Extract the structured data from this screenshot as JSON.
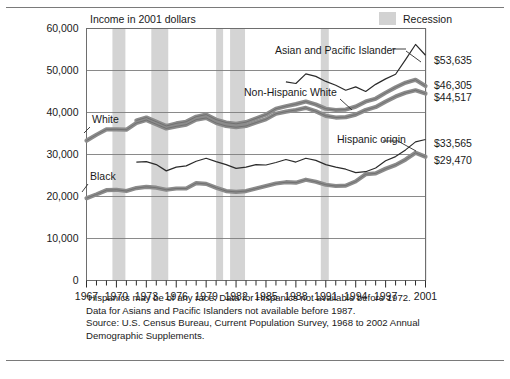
{
  "chart_data": {
    "type": "line",
    "title": "",
    "ylabel": "Income in 2001 dollars",
    "xlabel": "",
    "ylim": [
      0,
      60000
    ],
    "xlim": [
      1967,
      2001
    ],
    "grid": true,
    "ytick_labels": [
      "60,000",
      "50,000",
      "40,000",
      "30,000",
      "20,000",
      "10,000",
      "0"
    ],
    "ytick_values": [
      60000,
      50000,
      40000,
      30000,
      20000,
      10000,
      0
    ],
    "xtick_labels": [
      "1967",
      "1970",
      "1973",
      "1976",
      "1979",
      "1982",
      "1985",
      "1988",
      "1991",
      "1994",
      "1997",
      "2001"
    ],
    "xtick_values": [
      1967,
      1970,
      1973,
      1976,
      1979,
      1982,
      1985,
      1988,
      1991,
      1994,
      1997,
      2001
    ],
    "legend": [
      {
        "name": "Recession",
        "swatch": "#d2d2d2",
        "position": "top-right"
      }
    ],
    "recessions": [
      {
        "start": 1969.6,
        "end": 1970.9
      },
      {
        "start": 1973.5,
        "end": 1975.2
      },
      {
        "start": 1980.0,
        "end": 1980.7
      },
      {
        "start": 1981.4,
        "end": 1982.9
      },
      {
        "start": 1990.5,
        "end": 1991.3
      },
      {
        "start": 2001.0,
        "end": 2001.9
      }
    ],
    "series": [
      {
        "name": "White",
        "label": "White",
        "style": "thick",
        "color": "#8c8c8c",
        "end_value_label": "",
        "x": [
          1967,
          1968,
          1969,
          1970,
          1971,
          1972,
          1973,
          1974,
          1975,
          1976,
          1977,
          1978,
          1979,
          1980,
          1981,
          1982,
          1983,
          1984,
          1985,
          1986,
          1987,
          1988,
          1989,
          1990,
          1991,
          1992,
          1993,
          1994,
          1995,
          1996,
          1997,
          1998,
          1999,
          2000,
          2001
        ],
        "values": [
          33300,
          34700,
          36000,
          36000,
          35900,
          37500,
          38200,
          37200,
          36200,
          36700,
          37100,
          38300,
          38700,
          37500,
          36800,
          36500,
          36800,
          37600,
          38400,
          39700,
          40200,
          40600,
          41100,
          40300,
          39200,
          38800,
          38900,
          39500,
          40600,
          41300,
          42600,
          43800,
          44700,
          45300,
          44517
        ]
      },
      {
        "name": "Non-Hispanic White",
        "label": "Non-Hispanic White",
        "style": "thick",
        "color": "#8c8c8c",
        "end_value_label": "$46,305",
        "x": [
          1972,
          1973,
          1974,
          1975,
          1976,
          1977,
          1978,
          1979,
          1980,
          1981,
          1982,
          1983,
          1984,
          1985,
          1986,
          1987,
          1988,
          1989,
          1990,
          1991,
          1992,
          1993,
          1994,
          1995,
          1996,
          1997,
          1998,
          1999,
          2000,
          2001
        ],
        "values": [
          38100,
          38800,
          37800,
          36800,
          37400,
          37800,
          39000,
          39500,
          38300,
          37600,
          37300,
          37700,
          38600,
          39500,
          40900,
          41500,
          42000,
          42600,
          41900,
          40900,
          40600,
          40700,
          41400,
          42600,
          43300,
          44700,
          46000,
          47100,
          47800,
          46305
        ]
      },
      {
        "name": "Asian and Pacific Islander",
        "label": "Asian and Pacific Islander",
        "style": "thin",
        "color": "#2b2b2b",
        "end_value_label": "$53,635",
        "x": [
          1987,
          1988,
          1989,
          1990,
          1991,
          1992,
          1993,
          1994,
          1995,
          1996,
          1997,
          1998,
          1999,
          2000,
          2001
        ],
        "values": [
          47300,
          46900,
          49200,
          48600,
          47400,
          46500,
          45300,
          46100,
          45000,
          46700,
          48000,
          49100,
          52600,
          56200,
          53635
        ]
      },
      {
        "name": "Black",
        "label": "Black",
        "style": "thick",
        "color": "#8c8c8c",
        "end_value_label": "$29,470",
        "x": [
          1967,
          1968,
          1969,
          1970,
          1971,
          1972,
          1973,
          1974,
          1975,
          1976,
          1977,
          1978,
          1979,
          1980,
          1981,
          1982,
          1983,
          1984,
          1985,
          1986,
          1987,
          1988,
          1989,
          1990,
          1991,
          1992,
          1993,
          1994,
          1995,
          1996,
          1997,
          1998,
          1999,
          2000,
          2001
        ],
        "values": [
          19600,
          20500,
          21500,
          21600,
          21300,
          22000,
          22300,
          22100,
          21600,
          21900,
          21900,
          23200,
          23000,
          22100,
          21300,
          21100,
          21300,
          21900,
          22500,
          23100,
          23400,
          23300,
          24000,
          23500,
          22800,
          22500,
          22600,
          23600,
          25300,
          25500,
          26600,
          27500,
          28800,
          30400,
          29470
        ]
      },
      {
        "name": "Hispanic origin",
        "label": "Hispanic origin",
        "style": "thin",
        "color": "#2b2b2b",
        "end_value_label": "$33,565",
        "x": [
          1972,
          1973,
          1974,
          1975,
          1976,
          1977,
          1978,
          1979,
          1980,
          1981,
          1982,
          1983,
          1984,
          1985,
          1986,
          1987,
          1988,
          1989,
          1990,
          1991,
          1992,
          1993,
          1994,
          1995,
          1996,
          1997,
          1998,
          1999,
          2000,
          2001
        ],
        "values": [
          28200,
          28300,
          27600,
          26100,
          27000,
          27300,
          28400,
          29100,
          28300,
          27600,
          26700,
          27000,
          27600,
          27500,
          28100,
          28800,
          28200,
          29100,
          28600,
          27600,
          27000,
          26500,
          25700,
          25900,
          26800,
          28500,
          29500,
          31100,
          33000,
          33565
        ]
      }
    ],
    "annotations": [
      {
        "text": "White",
        "x_px": 92,
        "y_px": 123,
        "leader": "down-left"
      },
      {
        "text": "Black",
        "x_px": 90,
        "y_px": 180,
        "leader": "down-left"
      },
      {
        "text": "Asian and Pacific Islander",
        "x_px": 275,
        "y_px": 54,
        "leader": "right-down"
      },
      {
        "text": "Non-Hispanic White",
        "x_px": 244,
        "y_px": 96,
        "leader": "right-down"
      },
      {
        "text": "Hispanic origin",
        "x_px": 337,
        "y_px": 143,
        "leader": "right-down"
      }
    ],
    "right_value_labels": [
      {
        "text": "$53,635",
        "y_px": 64
      },
      {
        "text": "$46,305",
        "y_px": 89
      },
      {
        "text": "$44,517",
        "y_px": 101
      },
      {
        "text": "$33,565",
        "y_px": 147
      },
      {
        "text": "$29,470",
        "y_px": 164
      }
    ]
  },
  "legend": {
    "recession_label": "Recession"
  },
  "axis": {
    "y_title": "Income in 2001 dollars"
  },
  "footnote": {
    "line1": "‘Hispanics may be of any race. Data for Hispanics not available before 1972.",
    "line2": "Data for Asians and Pacific Islanders not available before 1987.",
    "line3": "Source: U.S. Census Bureau, Current Population Survey, 1968 to 2002 Annual",
    "line4": "Demographic Supplements."
  }
}
